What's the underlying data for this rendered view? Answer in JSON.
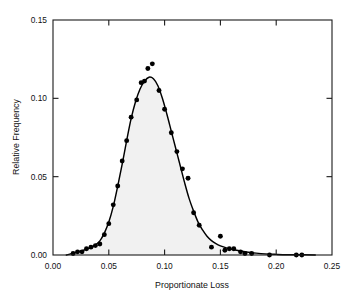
{
  "chart_data": {
    "type": "scatter",
    "title": "",
    "subtitle": "",
    "xlabel": "Proportionate Loss",
    "ylabel": "Relative Frequency",
    "xlim": [
      0.0,
      0.25
    ],
    "ylim": [
      0.0,
      0.15
    ],
    "xticks": [
      0.0,
      0.05,
      0.1,
      0.15,
      0.2,
      0.25
    ],
    "xtick_labels": [
      "0.00",
      "0.05",
      "0.10",
      "0.15",
      "0.20",
      "0.25"
    ],
    "yticks": [
      0.0,
      0.05,
      0.1,
      0.15
    ],
    "ytick_labels": [
      "0.00",
      "0.05",
      "0.10",
      "0.15"
    ],
    "grid": false,
    "legend": null,
    "legend_position": "none",
    "tick_direction": "in",
    "frame": "full-box",
    "colors": {
      "marker": "#000000",
      "curve": "#000000",
      "area_fill": "#f1f1f1",
      "axis": "#1a1a1a",
      "background": "#ffffff",
      "text": "#111111"
    },
    "annotations": [],
    "series": [
      {
        "name": "Observed relative frequency",
        "type": "scatter",
        "marker": "filled-circle",
        "points": [
          {
            "x": 0.018,
            "y": 0.001
          },
          {
            "x": 0.022,
            "y": 0.002
          },
          {
            "x": 0.026,
            "y": 0.002
          },
          {
            "x": 0.03,
            "y": 0.004
          },
          {
            "x": 0.034,
            "y": 0.005
          },
          {
            "x": 0.038,
            "y": 0.006
          },
          {
            "x": 0.042,
            "y": 0.007
          },
          {
            "x": 0.046,
            "y": 0.013
          },
          {
            "x": 0.05,
            "y": 0.02
          },
          {
            "x": 0.054,
            "y": 0.032
          },
          {
            "x": 0.058,
            "y": 0.044
          },
          {
            "x": 0.062,
            "y": 0.06
          },
          {
            "x": 0.066,
            "y": 0.073
          },
          {
            "x": 0.07,
            "y": 0.088
          },
          {
            "x": 0.075,
            "y": 0.099
          },
          {
            "x": 0.079,
            "y": 0.11
          },
          {
            "x": 0.082,
            "y": 0.111
          },
          {
            "x": 0.085,
            "y": 0.119
          },
          {
            "x": 0.089,
            "y": 0.122
          },
          {
            "x": 0.095,
            "y": 0.105
          },
          {
            "x": 0.1,
            "y": 0.093
          },
          {
            "x": 0.106,
            "y": 0.078
          },
          {
            "x": 0.111,
            "y": 0.066
          },
          {
            "x": 0.116,
            "y": 0.055
          },
          {
            "x": 0.121,
            "y": 0.049
          },
          {
            "x": 0.126,
            "y": 0.027
          },
          {
            "x": 0.131,
            "y": 0.019
          },
          {
            "x": 0.142,
            "y": 0.005
          },
          {
            "x": 0.15,
            "y": 0.012
          },
          {
            "x": 0.154,
            "y": 0.003
          },
          {
            "x": 0.158,
            "y": 0.004
          },
          {
            "x": 0.162,
            "y": 0.004
          },
          {
            "x": 0.168,
            "y": 0.002
          },
          {
            "x": 0.172,
            "y": 0.001
          },
          {
            "x": 0.178,
            "y": 0.001
          },
          {
            "x": 0.194,
            "y": 0.0
          },
          {
            "x": 0.218,
            "y": 0.0
          },
          {
            "x": 0.223,
            "y": 0.0
          }
        ]
      },
      {
        "name": "Fitted density curve",
        "type": "line",
        "fill_to_zero": true,
        "points": [
          {
            "x": 0.012,
            "y": 0.0
          },
          {
            "x": 0.02,
            "y": 0.0015
          },
          {
            "x": 0.028,
            "y": 0.0032
          },
          {
            "x": 0.036,
            "y": 0.0055
          },
          {
            "x": 0.042,
            "y": 0.009
          },
          {
            "x": 0.046,
            "y": 0.014
          },
          {
            "x": 0.05,
            "y": 0.021
          },
          {
            "x": 0.054,
            "y": 0.031
          },
          {
            "x": 0.058,
            "y": 0.044
          },
          {
            "x": 0.062,
            "y": 0.058
          },
          {
            "x": 0.066,
            "y": 0.073
          },
          {
            "x": 0.07,
            "y": 0.087
          },
          {
            "x": 0.074,
            "y": 0.098
          },
          {
            "x": 0.078,
            "y": 0.106
          },
          {
            "x": 0.082,
            "y": 0.111
          },
          {
            "x": 0.086,
            "y": 0.1135
          },
          {
            "x": 0.09,
            "y": 0.1125
          },
          {
            "x": 0.094,
            "y": 0.108
          },
          {
            "x": 0.098,
            "y": 0.1
          },
          {
            "x": 0.102,
            "y": 0.09
          },
          {
            "x": 0.106,
            "y": 0.079
          },
          {
            "x": 0.11,
            "y": 0.068
          },
          {
            "x": 0.114,
            "y": 0.057
          },
          {
            "x": 0.118,
            "y": 0.046
          },
          {
            "x": 0.122,
            "y": 0.036
          },
          {
            "x": 0.126,
            "y": 0.028
          },
          {
            "x": 0.13,
            "y": 0.021
          },
          {
            "x": 0.134,
            "y": 0.016
          },
          {
            "x": 0.138,
            "y": 0.012
          },
          {
            "x": 0.142,
            "y": 0.0092
          },
          {
            "x": 0.146,
            "y": 0.0072
          },
          {
            "x": 0.15,
            "y": 0.0058
          },
          {
            "x": 0.156,
            "y": 0.0044
          },
          {
            "x": 0.162,
            "y": 0.0034
          },
          {
            "x": 0.168,
            "y": 0.0026
          },
          {
            "x": 0.175,
            "y": 0.0018
          },
          {
            "x": 0.182,
            "y": 0.0012
          },
          {
            "x": 0.19,
            "y": 0.0007
          },
          {
            "x": 0.2,
            "y": 0.0004
          },
          {
            "x": 0.21,
            "y": 0.0002
          },
          {
            "x": 0.225,
            "y": 0.0001
          },
          {
            "x": 0.235,
            "y": 0.0
          }
        ]
      }
    ]
  }
}
